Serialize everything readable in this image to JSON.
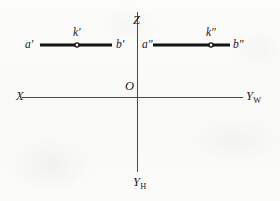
{
  "figure": {
    "background_color": "#fbfbfa",
    "ink_color": "#141414",
    "axis_color": "#4a4a4a",
    "width": 280,
    "height": 201
  },
  "axes": {
    "vertical": {
      "top_label": "Z",
      "bottom_label": "Y",
      "bottom_subscript": "H",
      "x": 137,
      "y_top": 12,
      "y_bottom": 172
    },
    "horizontal": {
      "left_label": "X",
      "right_label": "Y",
      "right_subscript": "W",
      "y": 97,
      "x_left": 22,
      "x_right": 243
    },
    "origin_label": "O",
    "origin_x": 137,
    "origin_y": 97
  },
  "projections": {
    "frontal": {
      "name": "frontal-projection",
      "start_label": "a'",
      "mid_label": "k'",
      "end_label": "b'",
      "x_start": 40,
      "x_end": 112,
      "y": 45,
      "mid_x": 77
    },
    "profile": {
      "name": "profile-projection",
      "start_label": "a\"",
      "mid_label": "k\"",
      "end_label": "b\"",
      "x_start": 153,
      "x_end": 230,
      "y": 45,
      "mid_x": 211
    }
  }
}
